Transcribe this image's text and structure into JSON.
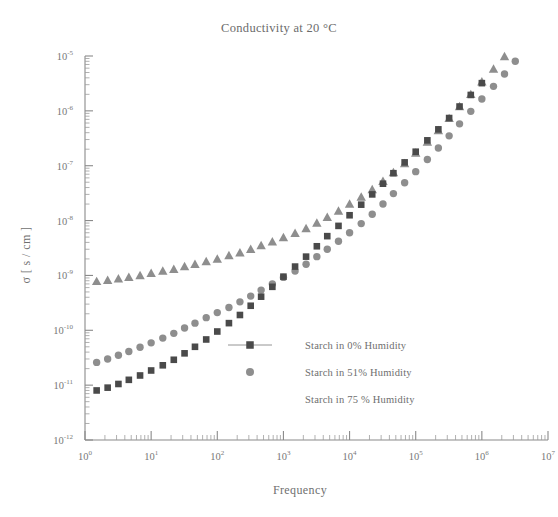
{
  "chart_data": {
    "type": "scatter",
    "title": "Conductivity at 20 °C",
    "xlabel": "Frequency",
    "ylabel": "σ [ s / cm ]",
    "xscale": "log",
    "yscale": "log",
    "xlim": [
      1,
      10000000
    ],
    "ylim": [
      1e-12,
      1e-05
    ],
    "grid": false,
    "legend_position": "center-right-inside",
    "xticks": [
      1,
      10,
      100,
      1000,
      10000,
      100000,
      1000000,
      10000000
    ],
    "xtick_labels": [
      "10⁰",
      "10¹",
      "10²",
      "10³",
      "10⁴",
      "10⁵",
      "10⁶",
      "10⁷"
    ],
    "xtick_bases": [
      "10",
      "10",
      "10",
      "10",
      "10",
      "10",
      "10",
      "10"
    ],
    "xtick_exponents": [
      "0",
      "1",
      "2",
      "3",
      "4",
      "5",
      "6",
      "7"
    ],
    "yticks": [
      1e-12,
      1e-11,
      1e-10,
      1e-09,
      1e-08,
      1e-07,
      1e-06,
      1e-05
    ],
    "ytick_bases": [
      "10",
      "10",
      "10",
      "10",
      "10",
      "10",
      "10",
      "10"
    ],
    "ytick_exponents": [
      "-12",
      "-11",
      "-10",
      "-9",
      "-8",
      "-7",
      "-6",
      "-5"
    ],
    "series": [
      {
        "name": "Starch in 0% Humidity",
        "marker": "square",
        "color": "#4a4a4a",
        "legend_marker": "square-with-line",
        "x": [
          1.5,
          2.2,
          3.2,
          4.6,
          6.8,
          10,
          15,
          22,
          32,
          46,
          68,
          100,
          150,
          220,
          320,
          460,
          680,
          1000,
          1500,
          2200,
          3200,
          4600,
          6800,
          10000,
          15000,
          22000,
          32000,
          46000,
          68000,
          100000,
          150000,
          220000,
          320000,
          460000,
          680000,
          1000000
        ],
        "y": [
          8e-12,
          9e-12,
          1.05e-11,
          1.25e-11,
          1.5e-11,
          1.85e-11,
          2.3e-11,
          2.9e-11,
          3.8e-11,
          5e-11,
          6.8e-11,
          9.5e-11,
          1.35e-10,
          1.9e-10,
          2.8e-10,
          4.1e-10,
          6.2e-10,
          9.5e-10,
          1.45e-09,
          2.2e-09,
          3.4e-09,
          5.2e-09,
          8e-09,
          1.25e-08,
          1.95e-08,
          3e-08,
          4.7e-08,
          7.3e-08,
          1.15e-07,
          1.8e-07,
          2.9e-07,
          4.6e-07,
          7.4e-07,
          1.2e-06,
          1.95e-06,
          3.2e-06
        ]
      },
      {
        "name": "Starch in 51% Humidity",
        "marker": "circle",
        "color": "#8e8e8e",
        "legend_marker": "circle",
        "x": [
          1.5,
          2.2,
          3.2,
          4.6,
          6.8,
          10,
          15,
          22,
          32,
          46,
          68,
          100,
          150,
          220,
          320,
          460,
          680,
          1000,
          1500,
          2200,
          3200,
          4600,
          6800,
          10000,
          15000,
          22000,
          32000,
          46000,
          68000,
          100000,
          150000,
          220000,
          320000,
          460000,
          680000,
          1000000,
          1500000,
          2200000,
          3200000,
          4600000,
          6800000,
          10000000
        ],
        "y": [
          2.6e-11,
          3e-11,
          3.5e-11,
          4.1e-11,
          4.9e-11,
          5.9e-11,
          7.2e-11,
          8.8e-11,
          1.1e-10,
          1.35e-10,
          1.7e-10,
          2.1e-10,
          2.6e-10,
          3.3e-10,
          4.2e-10,
          5.4e-10,
          7e-10,
          9.2e-10,
          1.2e-09,
          1.6e-09,
          2.2e-09,
          3e-09,
          4.2e-09,
          6e-09,
          8.8e-09,
          1.3e-08,
          2e-08,
          3.1e-08,
          4.9e-08,
          7.8e-08,
          1.3e-07,
          2.1e-07,
          3.5e-07,
          5.8e-07,
          9.8e-07,
          1.65e-06,
          2.8e-06,
          4.7e-06,
          8e-06,
          1.35e-05,
          2.3e-05,
          3.9e-05
        ]
      },
      {
        "name": "Starch in 75 % Humidity",
        "marker": "triangle",
        "color": "#8e8e8e",
        "legend_marker": "none",
        "x": [
          1.5,
          2.2,
          3.2,
          4.6,
          6.8,
          10,
          15,
          22,
          32,
          46,
          68,
          100,
          150,
          220,
          320,
          460,
          680,
          1000,
          1500,
          2200,
          3200,
          4600,
          6800,
          10000,
          15000,
          22000,
          32000,
          46000,
          68000,
          100000,
          150000,
          220000,
          320000,
          460000,
          680000,
          1000000,
          1500000,
          2200000,
          3200000,
          4600000,
          6800000,
          10000000
        ],
        "y": [
          7.8e-10,
          8.2e-10,
          8.7e-10,
          9.3e-10,
          1e-09,
          1.1e-09,
          1.2e-09,
          1.3e-09,
          1.45e-09,
          1.6e-09,
          1.8e-09,
          2e-09,
          2.3e-09,
          2.6e-09,
          3e-09,
          3.5e-09,
          4.1e-09,
          4.9e-09,
          5.9e-09,
          7.2e-09,
          9e-09,
          1.15e-08,
          1.5e-08,
          2e-08,
          2.7e-08,
          3.7e-08,
          5.2e-08,
          7.5e-08,
          1.1e-07,
          1.7e-07,
          2.7e-07,
          4.4e-07,
          7.3e-07,
          1.2e-06,
          2e-06,
          3.4e-06,
          5.8e-06,
          9.8e-06,
          1.65e-05,
          2.8e-05,
          4.6e-05,
          7.5e-05
        ]
      }
    ]
  },
  "legend": {
    "items": [
      {
        "label": "Starch in 0% Humidity"
      },
      {
        "label": "Starch in 51% Humidity"
      },
      {
        "label": "Starch in 75 % Humidity"
      }
    ]
  },
  "colors": {
    "series_0": "#4a4a4a",
    "series_1": "#8e8e8e",
    "series_2": "#8e8e8e",
    "axis": "#8a8a8a",
    "text": "#6e6e6e",
    "background": "#ffffff"
  }
}
